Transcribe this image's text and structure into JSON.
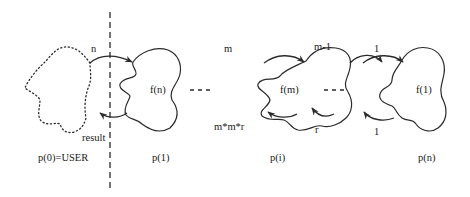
{
  "diagram": {
    "type": "process-chain",
    "divider": {
      "style": "dashed",
      "x": 110
    },
    "processes": [
      {
        "id": "p0",
        "label": "p(0)=USER",
        "function_label": "",
        "style": "dotted"
      },
      {
        "id": "p1",
        "label": "p(1)",
        "function_label": "f(n)",
        "style": "solid"
      },
      {
        "id": "pi",
        "label": "p(i)",
        "function_label": "f(m)",
        "style": "solid"
      },
      {
        "id": "pn",
        "label": "p(n)",
        "function_label": "f(1)",
        "style": "solid"
      }
    ],
    "arrows": [
      {
        "from": "p0",
        "to": "p1",
        "label": "n"
      },
      {
        "from": "p1",
        "to": "p0",
        "label": "result"
      },
      {
        "from": "prev",
        "to": "pi",
        "label": "m"
      },
      {
        "from": "pi",
        "to": "prev",
        "label": "m*m*r"
      },
      {
        "from": "pi",
        "to": "next",
        "label": "m-1"
      },
      {
        "from": "next",
        "to": "pi",
        "label": "r"
      },
      {
        "from": "prev",
        "to": "pn",
        "label": "1"
      },
      {
        "from": "pn",
        "to": "prev",
        "label": "1"
      }
    ],
    "ellipses": [
      "- - -",
      "- - -"
    ]
  }
}
